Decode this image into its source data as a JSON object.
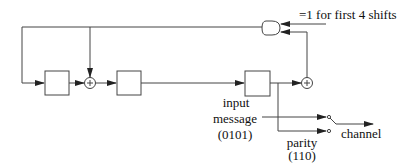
{
  "diagram": {
    "labels": {
      "and_condition": "=1 for first 4 shifts",
      "input": "input",
      "message": "message",
      "message_bits": "(0101)",
      "parity": "parity",
      "parity_bits": "(110)",
      "channel": "channel"
    },
    "components": [
      {
        "type": "shift-register",
        "id": "reg1"
      },
      {
        "type": "xor",
        "id": "xor1"
      },
      {
        "type": "shift-register",
        "id": "reg2"
      },
      {
        "type": "shift-register",
        "id": "reg3"
      },
      {
        "type": "xor",
        "id": "xor2"
      },
      {
        "type": "and-gate",
        "id": "and1"
      },
      {
        "type": "switch",
        "id": "output-switch"
      }
    ],
    "colors": {
      "line": "#333333",
      "background": "#ffffff"
    }
  }
}
